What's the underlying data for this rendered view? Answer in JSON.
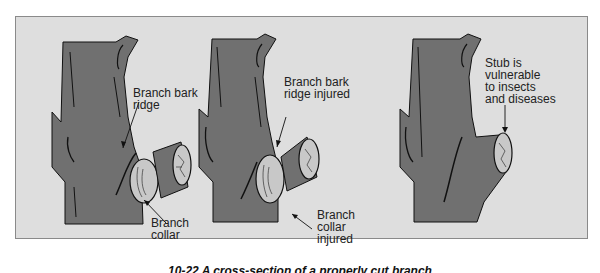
{
  "figure": {
    "panels": [
      {
        "id": "proper-cut",
        "labels": [
          {
            "text": "Branch bark\nridge",
            "target": "branch-bark-ridge"
          },
          {
            "text": "Branch\ncollar",
            "target": "branch-collar"
          }
        ]
      },
      {
        "id": "flush-cut",
        "labels": [
          {
            "text": "Branch bark\nridge injured",
            "target": "branch-bark-ridge"
          },
          {
            "text": "Branch\ncollar\ninjured",
            "target": "branch-collar"
          }
        ]
      },
      {
        "id": "stub-cut",
        "labels": [
          {
            "text": "Stub is\nvulnerable\nto insects\nand diseases",
            "target": "stub"
          }
        ]
      }
    ],
    "caption": "10-22  A cross-section of a properly cut branch"
  },
  "colors": {
    "frame_bg": "#dedede",
    "frame_border": "#8a8a8a",
    "bark": "#707070",
    "cut_face": "#c8c8c8",
    "ink": "#111111"
  }
}
